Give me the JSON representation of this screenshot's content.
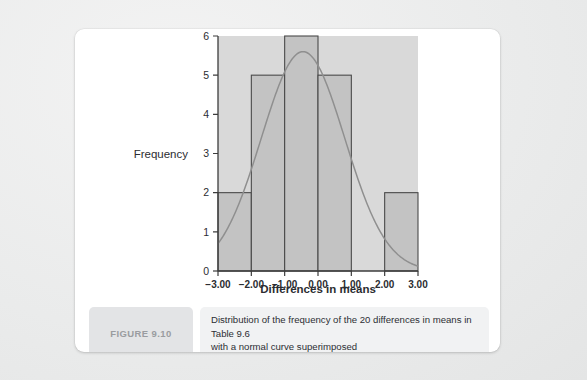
{
  "figure": {
    "badge_label": "FIGURE 9.10",
    "caption_line_1": "Distribution of the frequency of the 20 differences in means in Table 9.6",
    "caption_line_2": "with a normal curve superimposed"
  },
  "colors": {
    "page_background": "#eceded",
    "card_background": "#ffffff",
    "plot_background": "#d9d9d9",
    "bar_fill": "#c3c3c3",
    "bar_stroke": "#4a4a4a",
    "curve_stroke": "#8f8f8f",
    "axis_stroke": "#3c3c3c",
    "badge_background": "#e3e4e6",
    "badge_text": "#9a9ca0",
    "caption_background": "#f1f2f3"
  },
  "chart_data": {
    "type": "bar",
    "title": "",
    "subtitle": "",
    "xlabel": "Differences in means",
    "ylabel": "Frequency",
    "xlim": [
      -3.0,
      3.0
    ],
    "ylim": [
      0,
      6
    ],
    "grid": false,
    "legend": "none",
    "x_tick_labels": [
      "-3.00",
      "-2.00",
      "-1.00",
      "0.00",
      "1.00",
      "2.00",
      "3.00"
    ],
    "x_tick_values": [
      -3.0,
      -2.0,
      -1.0,
      0.0,
      1.0,
      2.0,
      3.0
    ],
    "y_tick_labels": [
      "0",
      "1",
      "2",
      "3",
      "4",
      "5",
      "6"
    ],
    "y_tick_values": [
      0,
      1,
      2,
      3,
      4,
      5,
      6
    ],
    "bin_width": 1.0,
    "bins": [
      {
        "left": -3.0,
        "right": -2.0,
        "frequency": 2
      },
      {
        "left": -2.0,
        "right": -1.0,
        "frequency": 5
      },
      {
        "left": -1.0,
        "right": 0.0,
        "frequency": 6
      },
      {
        "left": 0.0,
        "right": 1.0,
        "frequency": 5
      },
      {
        "left": 1.0,
        "right": 2.0,
        "frequency": 0
      },
      {
        "left": 2.0,
        "right": 3.0,
        "frequency": 2
      }
    ],
    "categories": [
      "-3.00 to -2.00",
      "-2.00 to -1.00",
      "-1.00 to 0.00",
      "0.00 to 1.00",
      "1.00 to 2.00",
      "2.00 to 3.00"
    ],
    "values": [
      2,
      5,
      6,
      5,
      0,
      2
    ],
    "annotations": [
      {
        "type": "normal-curve",
        "label": "normal curve superimposed",
        "mean": -0.45,
        "sigma": 1.25,
        "peak_frequency": 5.6,
        "n": 20
      }
    ]
  }
}
